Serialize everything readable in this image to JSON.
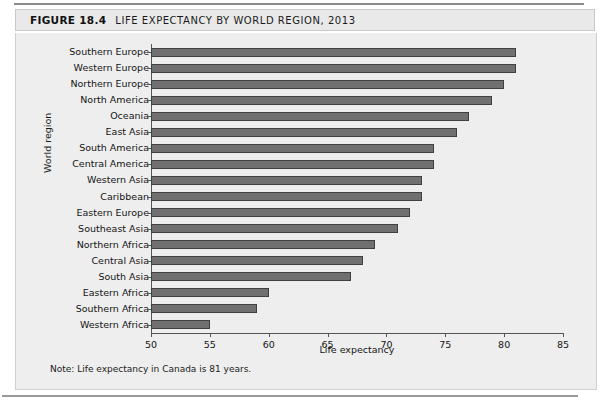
{
  "figure": {
    "number_label": "FIGURE 18.4",
    "title": "LIFE EXPECTANCY BY WORLD REGION, 2013",
    "note": "Note: Life expectancy in Canada is 81 years."
  },
  "chart_data": {
    "type": "bar",
    "orientation": "horizontal",
    "title": "LIFE EXPECTANCY BY WORLD REGION, 2013",
    "xlabel": "Life expectancy",
    "ylabel": "World region",
    "xlim": [
      50,
      85
    ],
    "xticks": [
      50,
      55,
      60,
      65,
      70,
      75,
      80,
      85
    ],
    "grid": false,
    "legend": null,
    "bar_color": "#707070",
    "bar_edge_color": "#3f3f3f",
    "categories": [
      "Southern Europe",
      "Western Europe",
      "Northern Europe",
      "North America",
      "Oceania",
      "East Asia",
      "South America",
      "Central America",
      "Western Asia",
      "Caribbean",
      "Eastern Europe",
      "Southeast Asia",
      "Northern Africa",
      "Central Asia",
      "South Asia",
      "Eastern Africa",
      "Southern Africa",
      "Western Africa"
    ],
    "values": [
      81,
      81,
      80,
      79,
      77,
      76,
      74,
      74,
      73,
      73,
      72,
      71,
      69,
      68,
      67,
      60,
      59,
      55
    ],
    "annotations": [
      "Note: Life expectancy in Canada is 81 years."
    ]
  }
}
